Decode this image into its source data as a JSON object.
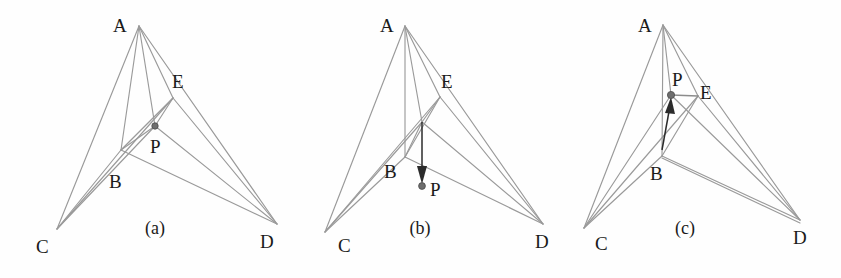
{
  "figure": {
    "background_color": "#fefefe",
    "edge_color": "#9a9a9a",
    "arrow_color": "#2b2b2b",
    "label_color": "#1a1a1a",
    "width": 841,
    "height": 278
  },
  "panels": [
    {
      "id": "a",
      "caption": "(a)",
      "caption_pos": {
        "x": 155,
        "y": 234
      },
      "vertices": [
        {
          "name": "A",
          "x": 139,
          "y": 26,
          "label": "A",
          "lx": 113,
          "ly": 32
        },
        {
          "name": "B",
          "x": 121,
          "y": 150,
          "label": "B",
          "lx": 109,
          "ly": 188
        },
        {
          "name": "C",
          "x": 57,
          "y": 229,
          "label": "C",
          "lx": 36,
          "ly": 253
        },
        {
          "name": "D",
          "x": 277,
          "y": 224,
          "label": "D",
          "lx": 260,
          "ly": 248
        },
        {
          "name": "E",
          "x": 173,
          "y": 98,
          "label": "E",
          "lx": 172,
          "ly": 88
        },
        {
          "name": "P",
          "x": 155,
          "y": 126,
          "label": "P",
          "lx": 150,
          "ly": 153
        }
      ],
      "edges": [
        [
          "A",
          "C"
        ],
        [
          "A",
          "B"
        ],
        [
          "A",
          "D"
        ],
        [
          "A",
          "E"
        ],
        [
          "A",
          "P"
        ],
        [
          "B",
          "C"
        ],
        [
          "B",
          "D"
        ],
        [
          "B",
          "E"
        ],
        [
          "B",
          "P"
        ],
        [
          "C",
          "E"
        ],
        [
          "C",
          "P"
        ],
        [
          "E",
          "D"
        ],
        [
          "P",
          "D"
        ],
        [
          "P",
          "E"
        ]
      ],
      "arrow": null,
      "point_marker": {
        "name": "P",
        "x": 155,
        "y": 126
      }
    },
    {
      "id": "b",
      "caption": "(b)",
      "caption_pos": {
        "x": 420,
        "y": 234
      },
      "vertices": [
        {
          "name": "A",
          "x": 405,
          "y": 26,
          "label": "A",
          "lx": 380,
          "ly": 32
        },
        {
          "name": "B",
          "x": 405,
          "y": 157,
          "label": "B",
          "lx": 384,
          "ly": 178
        },
        {
          "name": "C",
          "x": 325,
          "y": 232,
          "label": "C",
          "lx": 338,
          "ly": 252
        },
        {
          "name": "D",
          "x": 543,
          "y": 224,
          "label": "D",
          "lx": 535,
          "ly": 248
        },
        {
          "name": "E",
          "x": 440,
          "y": 97,
          "label": "E",
          "lx": 441,
          "ly": 88
        },
        {
          "name": "P",
          "x": 422,
          "y": 185,
          "label": "P",
          "lx": 430,
          "ly": 196
        }
      ],
      "edges": [
        [
          "A",
          "C"
        ],
        [
          "A",
          "B"
        ],
        [
          "A",
          "D"
        ],
        [
          "A",
          "E"
        ],
        [
          "A",
          "J"
        ],
        [
          "B",
          "C"
        ],
        [
          "B",
          "D"
        ],
        [
          "B",
          "E"
        ],
        [
          "B",
          "J"
        ],
        [
          "C",
          "E"
        ],
        [
          "C",
          "J"
        ],
        [
          "E",
          "D"
        ],
        [
          "J",
          "D"
        ],
        [
          "J",
          "E"
        ]
      ],
      "arrow": {
        "from_x": 422,
        "from_y": 122,
        "to_x": 422,
        "to_y": 178,
        "direction": "down"
      },
      "point_marker": {
        "name": "P",
        "x": 422,
        "y": 185
      }
    },
    {
      "id": "c",
      "caption": "(c)",
      "caption_pos": {
        "x": 685,
        "y": 234
      },
      "vertices": [
        {
          "name": "A",
          "x": 663,
          "y": 25,
          "label": "A",
          "lx": 638,
          "ly": 32
        },
        {
          "name": "B",
          "x": 662,
          "y": 156,
          "label": "B",
          "lx": 650,
          "ly": 180
        },
        {
          "name": "C",
          "x": 584,
          "y": 228,
          "label": "C",
          "lx": 595,
          "ly": 250
        },
        {
          "name": "D",
          "x": 800,
          "y": 220,
          "label": "D",
          "lx": 793,
          "ly": 244
        },
        {
          "name": "E",
          "x": 698,
          "y": 96,
          "label": "E",
          "lx": 700,
          "ly": 93
        },
        {
          "name": "P",
          "x": 671,
          "y": 95,
          "label": "P",
          "lx": 680,
          "ly": 86
        }
      ],
      "edges": [
        [
          "A",
          "C"
        ],
        [
          "A",
          "B"
        ],
        [
          "A",
          "D"
        ],
        [
          "A",
          "E"
        ],
        [
          "A",
          "P"
        ],
        [
          "B",
          "C"
        ],
        [
          "B",
          "D"
        ],
        [
          "B",
          "E"
        ],
        [
          "C",
          "E"
        ],
        [
          "C",
          "P"
        ],
        [
          "E",
          "D"
        ],
        [
          "B",
          "D2"
        ],
        [
          "P",
          "E"
        ]
      ],
      "arrow": {
        "from_x": 662,
        "from_y": 150,
        "to_x": 670,
        "to_y": 100,
        "direction": "up"
      },
      "point_marker": {
        "name": "P",
        "x": 671,
        "y": 95
      }
    }
  ]
}
